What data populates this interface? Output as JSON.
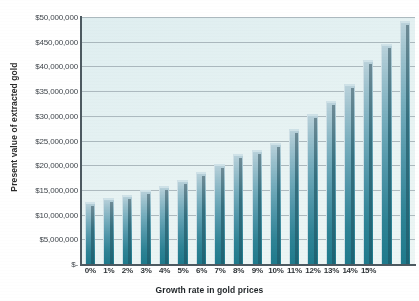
{
  "chart_data": {
    "type": "bar",
    "title": "",
    "xlabel": "Growth rate in gold prices",
    "ylabel": "Present value of extracted gold",
    "categories": [
      "0%",
      "1%",
      "2%",
      "3%",
      "4%",
      "5%",
      "6%",
      "7%",
      "8%",
      "9%",
      "10%",
      "11%",
      "12%",
      "13%",
      "14%",
      "15%"
    ],
    "values": [
      12500000,
      13300000,
      14000000,
      14900000,
      15900000,
      17100000,
      18600000,
      20300000,
      22300000,
      23100000,
      24600000,
      27300000,
      30300000,
      33000000,
      36500000,
      41300000
    ],
    "values_extra_note": "",
    "ylim": [
      0,
      50000000
    ],
    "ytick_values": [
      0,
      5000000,
      10000000,
      15000000,
      20000000,
      25000000,
      30000000,
      35000000,
      40000000,
      45000000,
      50000000
    ],
    "ytick_labels": [
      "$-",
      "$5,000,000",
      "$10,000,000",
      "$15,000,000",
      "$20,000,000",
      "$25,000,000",
      "$30,000,000",
      "$35,000,000",
      "$40,000,000",
      "$450,00,000",
      "$50,000,000"
    ],
    "grid": true,
    "legend": "none",
    "bar_color": "#2e8395",
    "bar_gradient_top": "#bcd3dc",
    "bar_gradient_bottom": "#1f7a8c",
    "plot_background": "#e4f1f2",
    "axis_color": "#4d5a61",
    "gridline_color": "#9aa7ad"
  },
  "chart_extra_bars": {
    "note": "two tallest bars at right",
    "values": [
      44600000,
      49200000
    ]
  }
}
